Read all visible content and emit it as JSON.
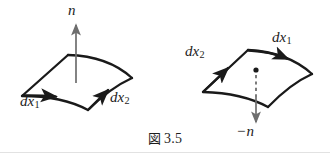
{
  "figure": {
    "caption_marker": "図",
    "caption_number": "3.5",
    "background_color": "#ffffff",
    "ink_color": "#1a1a1a",
    "normal_arrow_color": "#6e6e6e",
    "left_panel": {
      "name": "positively-oriented-surface-element",
      "labels": {
        "normal": "n",
        "normal_direction": "up",
        "tangent_1": "dx",
        "tangent_1_sub": "1",
        "tangent_2": "dx",
        "tangent_2_sub": "2"
      }
    },
    "right_panel": {
      "name": "negatively-oriented-surface-element",
      "labels": {
        "normal_sign": "−",
        "normal": "n",
        "normal_direction": "down",
        "tangent_1": "dx",
        "tangent_1_sub": "1",
        "tangent_2": "dx",
        "tangent_2_sub": "2"
      }
    }
  }
}
